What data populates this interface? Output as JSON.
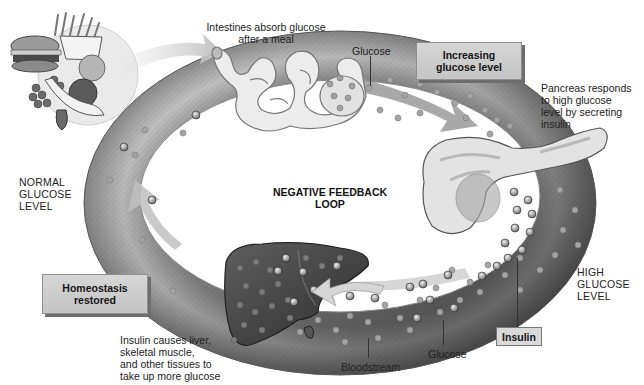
{
  "diagram": {
    "title": [
      "NEGATIVE FEEDBACK",
      "LOOP"
    ],
    "states": {
      "normal": [
        "NORMAL",
        "GLUCOSE",
        "LEVEL"
      ],
      "high": [
        "HIGH",
        "GLUCOSE",
        "LEVEL"
      ]
    },
    "boxes": {
      "increasing": [
        "Increasing",
        "glucose level"
      ],
      "homeostasis": [
        "Homeostasis",
        "restored"
      ],
      "insulin": "Insulin"
    },
    "captions": {
      "intestines": [
        "Intestines absorb glucose",
        "after a meal"
      ],
      "pancreas": [
        "Pancreas responds",
        "to high glucose",
        "level by secreting",
        "insulin"
      ],
      "liver": [
        "Insulin causes liver,",
        "skeletal muscle,",
        "and other tissues to",
        "take up more glucose"
      ]
    },
    "pointer_labels": {
      "glucose_top": "Glucose",
      "glucose_bottom": "Glucose",
      "bloodstream": "Bloodstream"
    },
    "illustrations": {
      "food": "meal-plate-icon",
      "intestines": "intestines-icon",
      "pancreas": "pancreas-icon",
      "liver": "liver-icon",
      "ring": "bloodstream-ring"
    },
    "colors": {
      "ring_light": "#c8c8c8",
      "ring_dark": "#5a5a5a",
      "box_fill": "#cfcfcf",
      "box_shadow": "#6e6e6e",
      "liver": "#4a4a4a",
      "pancreas": "#e2e2e2",
      "glucose_dot": "#9a9a9a",
      "insulin_dot": "#3a3a3a",
      "text": "#1a1a1a"
    }
  }
}
